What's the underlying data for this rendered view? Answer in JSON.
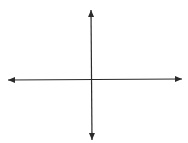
{
  "diagram": {
    "type": "coordinate-axes",
    "background": "#ffffff",
    "stroke_color": "#2a2a2a",
    "stroke_width": 1.2,
    "origin": {
      "x": 91.5,
      "y": 79.5
    },
    "x_axis": {
      "start": {
        "x": 8,
        "y": 80
      },
      "end": {
        "x": 182,
        "y": 79
      },
      "arrow_left": true,
      "arrow_right": true
    },
    "y_axis": {
      "start": {
        "x": 91,
        "y": 10
      },
      "end": {
        "x": 92,
        "y": 140
      },
      "arrow_top": true,
      "arrow_bottom": true
    },
    "labels": []
  }
}
